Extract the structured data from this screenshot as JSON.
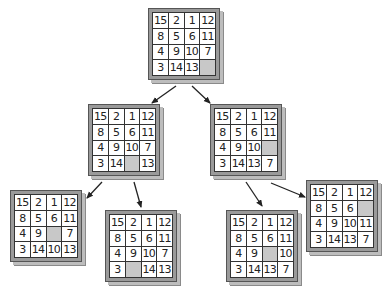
{
  "diagram": {
    "title": "",
    "blank_color": "#c8c8c8",
    "boards": [
      {
        "id": "root",
        "x": 148,
        "y": 8,
        "tiles": [
          "15",
          "2",
          "1",
          "12",
          "8",
          "5",
          "6",
          "11",
          "4",
          "9",
          "10",
          "7",
          "3",
          "14",
          "13",
          ""
        ]
      },
      {
        "id": "l1-left",
        "x": 88,
        "y": 104,
        "tiles": [
          "15",
          "2",
          "1",
          "12",
          "8",
          "5",
          "6",
          "11",
          "4",
          "9",
          "10",
          "7",
          "3",
          "14",
          "",
          "13"
        ]
      },
      {
        "id": "l1-right",
        "x": 210,
        "y": 104,
        "tiles": [
          "15",
          "2",
          "1",
          "12",
          "8",
          "5",
          "6",
          "11",
          "4",
          "9",
          "10",
          "",
          "3",
          "14",
          "13",
          "7"
        ]
      },
      {
        "id": "l2-a",
        "x": 10,
        "y": 190,
        "tiles": [
          "15",
          "2",
          "1",
          "12",
          "8",
          "5",
          "6",
          "11",
          "4",
          "9",
          "",
          "7",
          "3",
          "14",
          "10",
          "13"
        ]
      },
      {
        "id": "l2-b",
        "x": 105,
        "y": 210,
        "tiles": [
          "15",
          "2",
          "1",
          "12",
          "8",
          "5",
          "6",
          "11",
          "4",
          "9",
          "10",
          "7",
          "3",
          "",
          "14",
          "13"
        ]
      },
      {
        "id": "l2-c",
        "x": 226,
        "y": 210,
        "tiles": [
          "15",
          "2",
          "1",
          "12",
          "8",
          "5",
          "6",
          "11",
          "4",
          "9",
          "",
          "10",
          "3",
          "14",
          "13",
          "7"
        ]
      },
      {
        "id": "l2-d",
        "x": 306,
        "y": 180,
        "tiles": [
          "15",
          "2",
          "1",
          "12",
          "8",
          "5",
          "6",
          "",
          "4",
          "9",
          "10",
          "11",
          "3",
          "14",
          "13",
          "7"
        ]
      }
    ],
    "arrows": [
      {
        "from": "root",
        "to": "l1-left",
        "x1": 176,
        "y1": 86,
        "x2": 152,
        "y2": 103
      },
      {
        "from": "root",
        "to": "l1-right",
        "x1": 192,
        "y1": 86,
        "x2": 210,
        "y2": 103
      },
      {
        "from": "l1-left",
        "to": "l2-a",
        "x1": 102,
        "y1": 182,
        "x2": 87,
        "y2": 198
      },
      {
        "from": "l1-left",
        "to": "l2-b",
        "x1": 134,
        "y1": 182,
        "x2": 141,
        "y2": 207
      },
      {
        "from": "l1-right",
        "to": "l2-c",
        "x1": 246,
        "y1": 182,
        "x2": 262,
        "y2": 206
      },
      {
        "from": "l1-right",
        "to": "l2-d",
        "x1": 271,
        "y1": 183,
        "x2": 305,
        "y2": 197
      }
    ]
  }
}
